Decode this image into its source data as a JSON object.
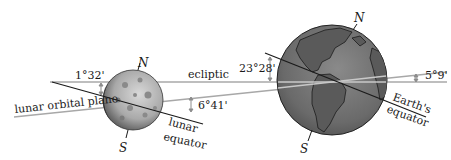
{
  "diagram": {
    "labels": {
      "ecliptic": "ecliptic",
      "lunar_orbital_plane": "lunar orbital plane",
      "lunar_equator_line1": "lunar",
      "lunar_equator_line2": "equator",
      "earth_equator_line1": "Earth's",
      "earth_equator_line2": "equator"
    },
    "angles": {
      "moon_equator_to_ecliptic": "1°32'",
      "lunar_orbit_to_ecliptic_near_moon": "6°41'",
      "earth_axial_tilt": "23°28'",
      "lunar_orbit_to_ecliptic": "5°9'"
    },
    "poles": {
      "moon_north": "N",
      "moon_south": "S",
      "earth_north": "N",
      "earth_south": "S"
    },
    "bodies": {
      "moon": "Moon",
      "earth": "Earth"
    },
    "colors": {
      "ecliptic_line": "#a8a8a8",
      "orbital_line": "#a8a8a8",
      "equator_line": "#1a1a1a",
      "earth_ocean": "#6b6b6b",
      "moon_surface": "#b5b5b5",
      "arrow": "#8c8c8c"
    }
  }
}
